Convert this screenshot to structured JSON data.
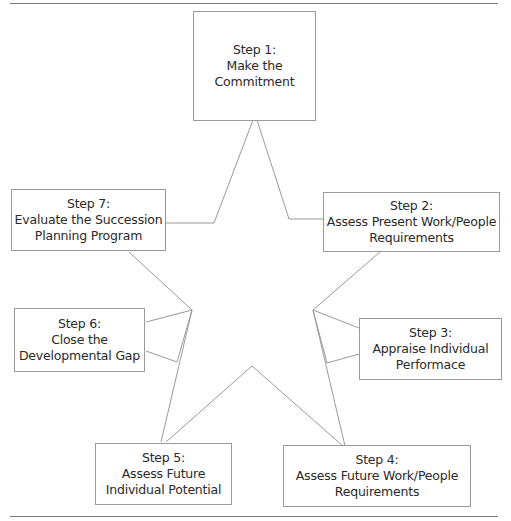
{
  "diagram": {
    "type": "star-cycle",
    "line_color": "#9a9a9a",
    "steps": [
      {
        "id": 1,
        "title": "Step 1:",
        "line1": "Make the",
        "line2": "Commitment"
      },
      {
        "id": 2,
        "title": "Step 2:",
        "line1": "Assess Present Work/People",
        "line2": "Requirements"
      },
      {
        "id": 3,
        "title": "Step 3:",
        "line1": "Appraise Individual",
        "line2": "Performace"
      },
      {
        "id": 4,
        "title": "Step 4:",
        "line1": "Assess Future Work/People",
        "line2": "Requirements"
      },
      {
        "id": 5,
        "title": "Step 5:",
        "line1": "Assess Future",
        "line2": "Individual Potential"
      },
      {
        "id": 6,
        "title": "Step 6:",
        "line1": "Close the",
        "line2": "Developmental Gap"
      },
      {
        "id": 7,
        "title": "Step 7:",
        "line1": "Evaluate the Succession",
        "line2": "Planning Program"
      }
    ]
  }
}
